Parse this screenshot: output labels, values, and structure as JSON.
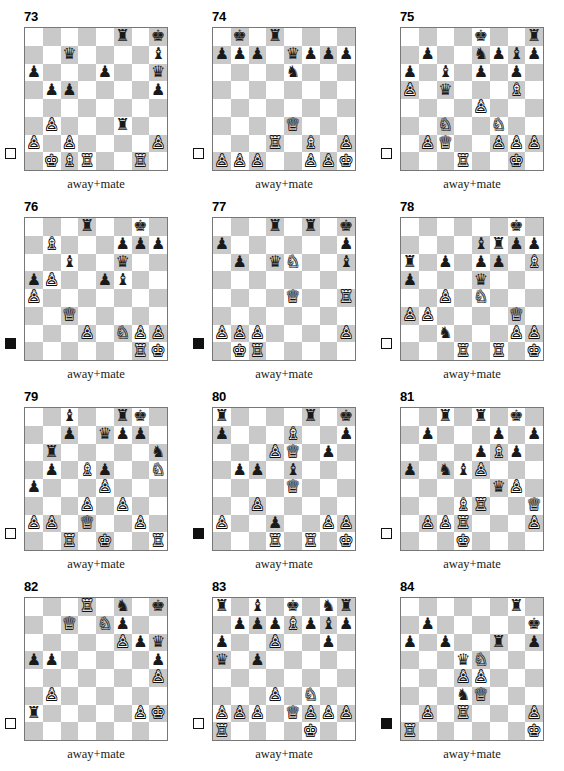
{
  "sheet": {
    "title": "Chess puzzle worksheet",
    "columns": 3,
    "rows": 4,
    "light_square_color": "#ffffff",
    "dark_square_color": "#c9c9c9",
    "border_color": "#777777",
    "piece_glyphs": {
      "wK": "♔",
      "wQ": "♕",
      "wR": "♖",
      "wB": "♗",
      "wN": "♘",
      "wP": "♙",
      "bK": "♚",
      "bQ": "♛",
      "bR": "♜",
      "bB": "♝",
      "bN": "♞",
      "bP": "♟"
    }
  },
  "puzzles": [
    {
      "number": "73",
      "caption": "away+mate",
      "side_to_move": "white",
      "side_to_move_marker": "empty-square",
      "position": [
        [
          "",
          "",
          "",
          "",
          "",
          "bR",
          "",
          "bK"
        ],
        [
          "",
          "",
          "bQ",
          "",
          "",
          "",
          "",
          "bB"
        ],
        [
          "bP",
          "",
          "",
          "",
          "bP",
          "",
          "",
          "bQ"
        ],
        [
          "",
          "bP",
          "bP",
          "",
          "",
          "",
          "",
          "bP"
        ],
        [
          "",
          "",
          "",
          "",
          "",
          "",
          "",
          ""
        ],
        [
          "",
          "wP",
          "",
          "",
          "",
          "bR",
          "",
          ""
        ],
        [
          "wP",
          "",
          "wP",
          "",
          "",
          "",
          "",
          "wP"
        ],
        [
          "",
          "wK",
          "wB",
          "wR",
          "",
          "",
          "wR",
          ""
        ]
      ]
    },
    {
      "number": "74",
      "caption": "away+mate",
      "side_to_move": "white",
      "side_to_move_marker": "empty-square",
      "position": [
        [
          "",
          "bK",
          "",
          "bR",
          "",
          "",
          "",
          ""
        ],
        [
          "bP",
          "bP",
          "bP",
          "",
          "bQ",
          "bP",
          "bP",
          "bP"
        ],
        [
          "",
          "",
          "",
          "",
          "bN",
          "",
          "",
          ""
        ],
        [
          "",
          "",
          "",
          "",
          "",
          "",
          "",
          ""
        ],
        [
          "",
          "",
          "",
          "",
          "",
          "",
          "",
          ""
        ],
        [
          "",
          "",
          "",
          "",
          "wQ",
          "",
          "",
          ""
        ],
        [
          "",
          "",
          "",
          "wR",
          "",
          "wB",
          "",
          "wP"
        ],
        [
          "wP",
          "wP",
          "wP",
          "",
          "",
          "wP",
          "wP",
          "wK"
        ]
      ]
    },
    {
      "number": "75",
      "caption": "away+mate",
      "side_to_move": "white",
      "side_to_move_marker": "empty-square",
      "position": [
        [
          "",
          "",
          "",
          "",
          "bK",
          "",
          "",
          "bR"
        ],
        [
          "",
          "bP",
          "",
          "",
          "bN",
          "bP",
          "bB",
          "bP"
        ],
        [
          "bP",
          "",
          "bB",
          "",
          "bP",
          "",
          "bP",
          ""
        ],
        [
          "wP",
          "",
          "bQ",
          "",
          "",
          "",
          "wB",
          ""
        ],
        [
          "",
          "",
          "",
          "",
          "wP",
          "",
          "",
          ""
        ],
        [
          "",
          "",
          "wN",
          "",
          "",
          "wN",
          "",
          ""
        ],
        [
          "",
          "wP",
          "wQ",
          "",
          "",
          "wP",
          "wP",
          "wP"
        ],
        [
          "",
          "",
          "",
          "wR",
          "",
          "",
          "wK",
          ""
        ]
      ]
    },
    {
      "number": "76",
      "caption": "away+mate",
      "side_to_move": "black",
      "side_to_move_marker": "filled-square",
      "position": [
        [
          "",
          "",
          "",
          "bR",
          "",
          "",
          "bK",
          ""
        ],
        [
          "",
          "wB",
          "",
          "",
          "",
          "bP",
          "bP",
          "bP"
        ],
        [
          "",
          "",
          "bB",
          "",
          "",
          "bQ",
          "",
          ""
        ],
        [
          "bP",
          "wP",
          "",
          "",
          "bP",
          "bB",
          "",
          ""
        ],
        [
          "wP",
          "",
          "",
          "",
          "",
          "",
          "",
          ""
        ],
        [
          "",
          "",
          "wQ",
          "",
          "",
          "",
          "",
          ""
        ],
        [
          "",
          "",
          "",
          "wP",
          "",
          "wN",
          "wP",
          "wP"
        ],
        [
          "",
          "",
          "",
          "",
          "",
          "",
          "wR",
          "wK"
        ]
      ]
    },
    {
      "number": "77",
      "caption": "away+mate",
      "side_to_move": "black",
      "side_to_move_marker": "filled-square",
      "position": [
        [
          "",
          "",
          "",
          "bR",
          "",
          "bR",
          "",
          "bK"
        ],
        [
          "bP",
          "",
          "",
          "",
          "",
          "",
          "",
          "bP"
        ],
        [
          "",
          "bP",
          "",
          "bQ",
          "wN",
          "",
          "",
          "bB"
        ],
        [
          "",
          "",
          "",
          "",
          "",
          "",
          "",
          ""
        ],
        [
          "",
          "",
          "",
          "",
          "wQ",
          "",
          "",
          "wR"
        ],
        [
          "",
          "",
          "",
          "",
          "",
          "",
          "",
          ""
        ],
        [
          "wP",
          "wP",
          "wP",
          "",
          "",
          "",
          "",
          "wP"
        ],
        [
          "",
          "wK",
          "wR",
          "",
          "",
          "",
          "",
          ""
        ]
      ]
    },
    {
      "number": "78",
      "caption": "away+mate",
      "side_to_move": "white",
      "side_to_move_marker": "empty-square",
      "position": [
        [
          "",
          "",
          "",
          "",
          "",
          "",
          "bK",
          ""
        ],
        [
          "",
          "",
          "",
          "",
          "bB",
          "bR",
          "bP",
          "bP"
        ],
        [
          "bR",
          "",
          "bP",
          "",
          "bP",
          "bP",
          "",
          "wB"
        ],
        [
          "bP",
          "",
          "",
          "",
          "bQ",
          "",
          "",
          ""
        ],
        [
          "",
          "",
          "wP",
          "",
          "wN",
          "",
          "",
          ""
        ],
        [
          "wP",
          "wP",
          "",
          "",
          "",
          "",
          "wQ",
          ""
        ],
        [
          "",
          "",
          "bN",
          "",
          "",
          "",
          "wP",
          "wP"
        ],
        [
          "",
          "",
          "",
          "wR",
          "",
          "wR",
          "",
          "wK"
        ]
      ]
    },
    {
      "number": "79",
      "caption": "away+mate",
      "side_to_move": "white",
      "side_to_move_marker": "empty-square",
      "position": [
        [
          "",
          "",
          "bB",
          "",
          "",
          "bR",
          "bK",
          ""
        ],
        [
          "",
          "",
          "bP",
          "",
          "bQ",
          "bP",
          "bP",
          ""
        ],
        [
          "",
          "bR",
          "",
          "",
          "",
          "",
          "",
          "bN"
        ],
        [
          "",
          "bP",
          "",
          "wB",
          "bP",
          "",
          "",
          "wN"
        ],
        [
          "bP",
          "",
          "",
          "",
          "wP",
          "",
          "",
          ""
        ],
        [
          "",
          "",
          "",
          "wP",
          "",
          "wP",
          "",
          ""
        ],
        [
          "wP",
          "wP",
          "",
          "wQ",
          "",
          "",
          "wP",
          ""
        ],
        [
          "",
          "",
          "wR",
          "",
          "wK",
          "",
          "",
          "wR"
        ]
      ]
    },
    {
      "number": "80",
      "caption": "away+mate",
      "side_to_move": "black",
      "side_to_move_marker": "filled-square",
      "position": [
        [
          "bR",
          "",
          "",
          "",
          "",
          "bR",
          "",
          "bK"
        ],
        [
          "bP",
          "",
          "",
          "",
          "wB",
          "",
          "",
          "bP"
        ],
        [
          "",
          "",
          "",
          "wP",
          "wQ",
          "",
          "bP",
          ""
        ],
        [
          "",
          "bP",
          "bP",
          "",
          "bB",
          "",
          "",
          ""
        ],
        [
          "",
          "",
          "",
          "",
          "wQ",
          "",
          "",
          ""
        ],
        [
          "",
          "",
          "wP",
          "",
          "",
          "",
          "",
          ""
        ],
        [
          "wP",
          "",
          "",
          "bP",
          "",
          "",
          "wP",
          "wP"
        ],
        [
          "",
          "",
          "",
          "wR",
          "",
          "wR",
          "",
          "wK"
        ]
      ]
    },
    {
      "number": "81",
      "caption": "away+mate",
      "side_to_move": "white",
      "side_to_move_marker": "empty-square",
      "position": [
        [
          "",
          "",
          "bR",
          "",
          "bR",
          "",
          "bK",
          ""
        ],
        [
          "",
          "bP",
          "",
          "",
          "",
          "bP",
          "",
          "bP"
        ],
        [
          "",
          "",
          "",
          "",
          "bP",
          "wB",
          "bP",
          ""
        ],
        [
          "bP",
          "",
          "bN",
          "bB",
          "wP",
          "",
          "",
          ""
        ],
        [
          "",
          "",
          "",
          "",
          "",
          "bQ",
          "wP",
          ""
        ],
        [
          "",
          "",
          "",
          "wB",
          "wR",
          "",
          "",
          "wQ"
        ],
        [
          "",
          "wP",
          "wP",
          "wR",
          "",
          "",
          "",
          "wP"
        ],
        [
          "",
          "",
          "",
          "wK",
          "",
          "",
          "",
          ""
        ]
      ]
    },
    {
      "number": "82",
      "caption": "away+mate",
      "side_to_move": "white",
      "side_to_move_marker": "empty-square",
      "position": [
        [
          "",
          "",
          "",
          "wR",
          "",
          "bN",
          "",
          "bK"
        ],
        [
          "",
          "",
          "wQ",
          "",
          "wN",
          "bP",
          "",
          ""
        ],
        [
          "",
          "",
          "",
          "",
          "",
          "wP",
          "bP",
          "bQ"
        ],
        [
          "bP",
          "bP",
          "",
          "",
          "",
          "",
          "",
          "bP"
        ],
        [
          "",
          "",
          "",
          "",
          "",
          "",
          "",
          "wP"
        ],
        [
          "",
          "wP",
          "",
          "",
          "",
          "",
          "",
          ""
        ],
        [
          "bR",
          "",
          "",
          "",
          "",
          "",
          "wP",
          "wK"
        ],
        [
          "",
          "",
          "",
          "",
          "",
          "",
          "",
          ""
        ]
      ]
    },
    {
      "number": "83",
      "caption": "away+mate",
      "side_to_move": "white",
      "side_to_move_marker": "empty-square",
      "position": [
        [
          "bR",
          "",
          "bB",
          "",
          "bK",
          "",
          "bN",
          "bR"
        ],
        [
          "",
          "bP",
          "bP",
          "bP",
          "wB",
          "bP",
          "bB",
          "bP"
        ],
        [
          "bP",
          "",
          "",
          "wP",
          "",
          "",
          "bP",
          ""
        ],
        [
          "bQ",
          "",
          "bP",
          "",
          "",
          "",
          "",
          ""
        ],
        [
          "",
          "",
          "",
          "",
          "",
          "",
          "",
          ""
        ],
        [
          "",
          "",
          "",
          "wP",
          "",
          "wN",
          "",
          ""
        ],
        [
          "wP",
          "wP",
          "wP",
          "",
          "wQ",
          "wP",
          "wP",
          "wP"
        ],
        [
          "wR",
          "",
          "",
          "",
          "",
          "wK",
          "",
          ""
        ]
      ]
    },
    {
      "number": "84",
      "caption": "away+mate",
      "side_to_move": "black",
      "side_to_move_marker": "filled-square",
      "position": [
        [
          "",
          "",
          "",
          "",
          "",
          "",
          "bR",
          ""
        ],
        [
          "",
          "bP",
          "",
          "",
          "",
          "",
          "",
          "bK"
        ],
        [
          "bP",
          "",
          "bP",
          "",
          "",
          "bR",
          "",
          "bP"
        ],
        [
          "",
          "",
          "",
          "bQ",
          "wN",
          "",
          "",
          ""
        ],
        [
          "",
          "",
          "",
          "wP",
          "wP",
          "",
          "",
          ""
        ],
        [
          "",
          "",
          "",
          "bN",
          "wQ",
          "",
          "",
          ""
        ],
        [
          "",
          "wP",
          "",
          "wR",
          "",
          "",
          "",
          "wP"
        ],
        [
          "wR",
          "",
          "",
          "",
          "",
          "",
          "",
          "wK"
        ]
      ]
    }
  ]
}
